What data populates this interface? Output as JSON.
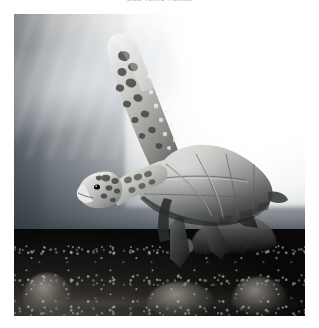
{
  "page": {
    "background_color": "#ffffff",
    "width": 319,
    "height": 328
  },
  "caption": {
    "text": "Sea Turtle Hawaii",
    "color": "#b9b9bf",
    "alignment": "center",
    "clipped": "true"
  },
  "photo": {
    "name": "underwater-sea-turtle-photograph",
    "alt_text": "Green sea turtle swimming underwater over a dark coral reef with sunlight above",
    "left": 14,
    "top": 14,
    "width": 291,
    "height": 302,
    "palette": {
      "highlight": "#ffffff",
      "water_upper": "#eceeef",
      "water_mid": "#868e94",
      "water_lower": "#20242 8",
      "reef_dark": "#040405",
      "turtle_shell": "#6f7370",
      "turtle_highlight": "#d2d4d0"
    },
    "subjects": [
      {
        "name": "green-sea-turtle-swimming",
        "description": "Large green sea turtle in profile, front flipper raised upward, swimming diagonally toward the lower left"
      },
      {
        "name": "resting-turtle-on-reef",
        "description": "Second turtle resting on the coral reef in the lower right"
      },
      {
        "name": "sun-glow",
        "description": "Blown-out sunlight glow in the upper right of the water column"
      },
      {
        "name": "coral-reef-floor",
        "description": "Dark textured rocky coral reef across the bottom of the frame"
      }
    ]
  }
}
